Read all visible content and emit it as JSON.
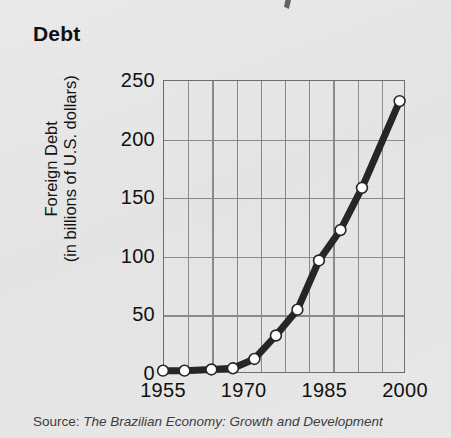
{
  "figure": {
    "title": "Debt",
    "source_prefix": "Source:",
    "source_work": "The Brazilian Economy: Growth and Development",
    "axis_color": "#6e6e6e",
    "grid_color": "#8a8a8a",
    "line_color": "#262626",
    "marker_fill": "#ffffff",
    "background": "#e9e9e9"
  },
  "chart_data": {
    "type": "line",
    "title": "Debt",
    "xlabel": "",
    "ylabel": "Foreign Debt (in billions of U.S. dollars)",
    "ylabel_line1": "Foreign Debt",
    "ylabel_line2": "(in billions of U.S. dollars)",
    "xlim": [
      1955,
      2000
    ],
    "ylim": [
      0,
      250
    ],
    "yticks": [
      0,
      50,
      100,
      150,
      200,
      250
    ],
    "ytick_labels": [
      "0",
      "50",
      "100",
      "150",
      "200",
      "250"
    ],
    "xticks": [
      1955,
      1970,
      1985,
      2000
    ],
    "xtick_labels": [
      "1955",
      "1970",
      "1985",
      "2000"
    ],
    "grid": true,
    "grid_x_divisions": 10,
    "grid_y_divisions": 5,
    "legend": null,
    "marker": "circle",
    "series": [
      {
        "name": "Foreign Debt",
        "x": [
          1955,
          1959,
          1964,
          1968,
          1972,
          1976,
          1980,
          1984,
          1988,
          1992,
          1999
        ],
        "values": [
          2,
          2,
          3,
          4,
          12,
          32,
          54,
          96,
          122,
          158,
          232
        ]
      }
    ]
  }
}
